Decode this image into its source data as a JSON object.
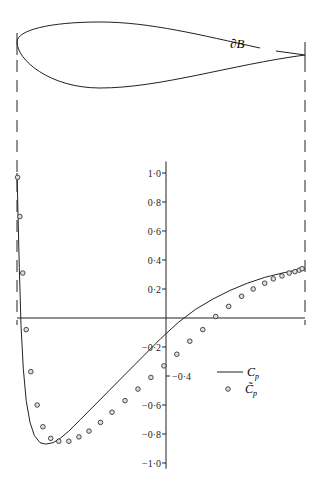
{
  "chart_data": {
    "type": "line",
    "title": "",
    "xlabel": "",
    "ylabel": "",
    "ylim": [
      -1.0,
      1.0
    ],
    "xlim": [
      0,
      1
    ],
    "grid": false,
    "legend_position": "center-right",
    "profile_label": "∂B",
    "y_ticks": [
      1.0,
      0.8,
      0.6,
      0.4,
      0.2,
      -0.2,
      -0.4,
      -0.6,
      -0.8,
      -1.0
    ],
    "y_tick_labels": [
      "1·0",
      "0·8",
      "0·6",
      "0·4",
      "0·2",
      "−0·2",
      "−0·4",
      "−0·6",
      "−0·8",
      "−1·0"
    ],
    "legend": [
      {
        "name": "C_p",
        "label_main": "C",
        "label_sub": "p",
        "style": "line"
      },
      {
        "name": "C̃_p",
        "label_main": "C̃",
        "label_sub": "p",
        "style": "circle-marker"
      }
    ],
    "series": [
      {
        "name": "C_p",
        "style": "line",
        "x": [
          0.0,
          0.003,
          0.008,
          0.014,
          0.022,
          0.032,
          0.045,
          0.06,
          0.08,
          0.1,
          0.125,
          0.15,
          0.18,
          0.22,
          0.27,
          0.32,
          0.38,
          0.44,
          0.5,
          0.56,
          0.62,
          0.68,
          0.74,
          0.8,
          0.86,
          0.92,
          0.97,
          1.0
        ],
        "values": [
          1.0,
          0.75,
          0.35,
          -0.05,
          -0.35,
          -0.57,
          -0.72,
          -0.81,
          -0.86,
          -0.87,
          -0.86,
          -0.83,
          -0.78,
          -0.7,
          -0.6,
          -0.5,
          -0.38,
          -0.26,
          -0.14,
          -0.03,
          0.06,
          0.13,
          0.19,
          0.24,
          0.28,
          0.31,
          0.33,
          0.34
        ]
      },
      {
        "name": "C̃_p",
        "style": "markers",
        "x": [
          0.002,
          0.01,
          0.02,
          0.032,
          0.048,
          0.07,
          0.09,
          0.117,
          0.145,
          0.18,
          0.215,
          0.25,
          0.29,
          0.33,
          0.375,
          0.42,
          0.465,
          0.51,
          0.555,
          0.6,
          0.645,
          0.69,
          0.735,
          0.78,
          0.82,
          0.86,
          0.89,
          0.92,
          0.945,
          0.965,
          0.98,
          0.99
        ],
        "values": [
          0.97,
          0.7,
          0.31,
          -0.08,
          -0.37,
          -0.6,
          -0.75,
          -0.83,
          -0.85,
          -0.85,
          -0.82,
          -0.78,
          -0.72,
          -0.65,
          -0.57,
          -0.49,
          -0.41,
          -0.33,
          -0.25,
          -0.16,
          -0.08,
          0.01,
          0.08,
          0.15,
          0.2,
          0.24,
          0.27,
          0.29,
          0.31,
          0.32,
          0.33,
          0.34
        ]
      }
    ]
  }
}
